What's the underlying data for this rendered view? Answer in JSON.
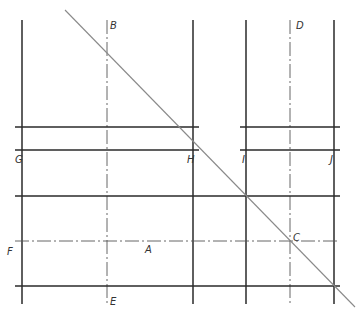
{
  "diagram": {
    "colors": {
      "solid": "#2a2a2a",
      "center": "#555555",
      "diagonal": "#8a8a8a",
      "background": "#ffffff"
    },
    "labels": {
      "A": "A",
      "B": "B",
      "C": "C",
      "D": "D",
      "E": "E",
      "F": "F",
      "G": "G",
      "H": "H",
      "I": "I",
      "J": "J"
    },
    "vertical_solid_lines_x": [
      22,
      193,
      246,
      334
    ],
    "vertical_center_lines": [
      {
        "label": "B-E",
        "x": 107
      },
      {
        "label": "D",
        "x": 290
      }
    ],
    "horizontal_solid_lines_y": [
      127,
      150,
      196,
      286
    ],
    "horizontal_center_line": {
      "label": "F-A-C",
      "y": 241
    },
    "diagonal": {
      "from": [
        65,
        10
      ],
      "to": [
        355,
        307
      ]
    }
  }
}
